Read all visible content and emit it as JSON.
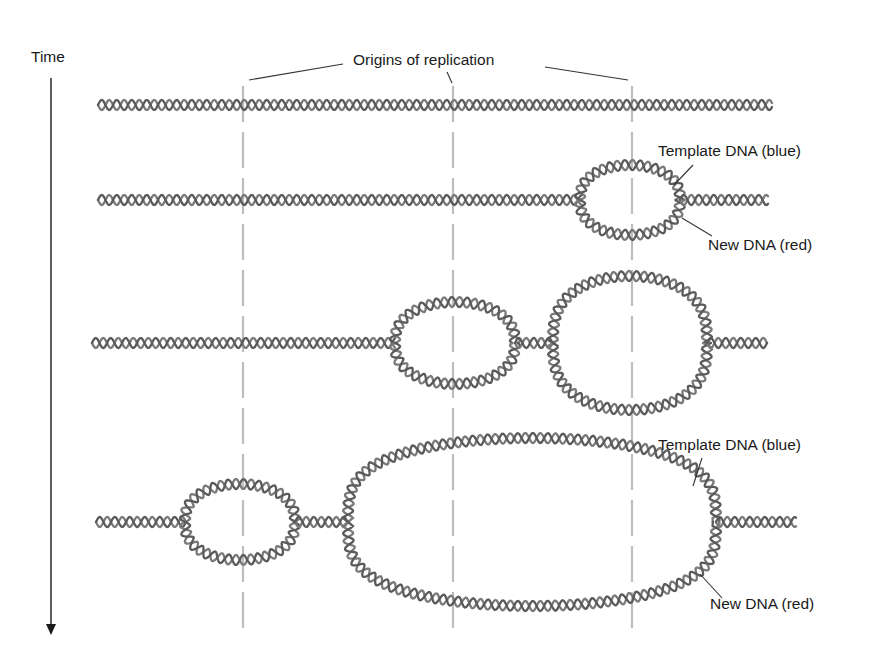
{
  "figure": {
    "time_label": "Time",
    "origins_label": "Origins of replication",
    "stages": [
      {
        "name": "stage-1",
        "description": "Unreplicated DNA",
        "bubbles": []
      },
      {
        "name": "stage-2",
        "description": "Replication bubble at third origin",
        "labels": {
          "template": "Template DNA (blue)",
          "new": "New DNA (red)"
        }
      },
      {
        "name": "stage-3",
        "description": "Bubbles at second and third origins"
      },
      {
        "name": "stage-4",
        "description": "Bubble at first origin; merged bubble spanning second and third origins",
        "labels": {
          "template": "Template DNA (blue)",
          "new": "New DNA (red)"
        }
      }
    ],
    "origin_x": [
      243,
      453,
      632
    ],
    "colors": {
      "template_strand": "#7a7a7a",
      "new_strand": "#5a5a5a",
      "origin_line": "#bdbdbd",
      "text": "#1a1a1a"
    }
  }
}
